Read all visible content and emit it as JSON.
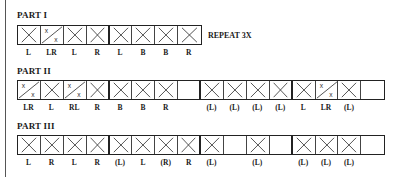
{
  "parts": [
    {
      "title": "PART I",
      "note": "REPEAT 3X",
      "cells": [
        {
          "mark": "X",
          "label": "L"
        },
        {
          "mark": "split",
          "label": "LR"
        },
        {
          "mark": "X",
          "label": "L"
        },
        {
          "mark": "X",
          "label": "R"
        },
        {
          "mark": "X",
          "label": "L"
        },
        {
          "mark": "X",
          "label": "B"
        },
        {
          "mark": "X",
          "label": "B"
        },
        {
          "mark": "X",
          "label": "R"
        }
      ]
    },
    {
      "title": "PART II",
      "cells": [
        {
          "mark": "split",
          "label": "LR"
        },
        {
          "mark": "X",
          "label": "L"
        },
        {
          "mark": "split",
          "label": "RL"
        },
        {
          "mark": "X",
          "label": "R"
        },
        {
          "mark": "X",
          "label": "B"
        },
        {
          "mark": "X",
          "label": "B"
        },
        {
          "mark": "X",
          "label": "R"
        },
        {
          "mark": "empty",
          "label": ""
        },
        {
          "mark": "X",
          "label": "(L)"
        },
        {
          "mark": "X",
          "label": "(L)"
        },
        {
          "mark": "X",
          "label": "(L)"
        },
        {
          "mark": "X",
          "label": "(L)"
        },
        {
          "mark": "X",
          "label": "L"
        },
        {
          "mark": "split",
          "label": "LR"
        },
        {
          "mark": "X",
          "label": "(L)"
        },
        {
          "mark": "empty",
          "label": ""
        }
      ]
    },
    {
      "title": "PART III",
      "cells": [
        {
          "mark": "X",
          "label": "L"
        },
        {
          "mark": "X",
          "label": "R"
        },
        {
          "mark": "X",
          "label": "L"
        },
        {
          "mark": "X",
          "label": "R"
        },
        {
          "mark": "X",
          "label": "(L)"
        },
        {
          "mark": "X",
          "label": "L"
        },
        {
          "mark": "X",
          "label": "(R)"
        },
        {
          "mark": "X",
          "label": "R"
        },
        {
          "mark": "X",
          "label": "(L)"
        },
        {
          "mark": "empty",
          "label": ""
        },
        {
          "mark": "X",
          "label": "(L)"
        },
        {
          "mark": "empty",
          "label": ""
        },
        {
          "mark": "X",
          "label": "(L)"
        },
        {
          "mark": "X",
          "label": "(L)"
        },
        {
          "mark": "X",
          "label": "(L)"
        },
        {
          "mark": "empty",
          "label": ""
        }
      ]
    }
  ]
}
